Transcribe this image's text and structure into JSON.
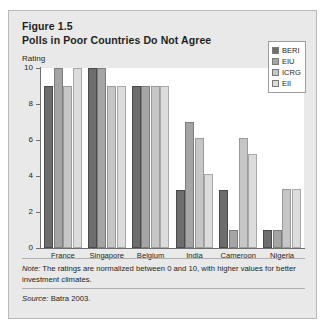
{
  "figure": {
    "number_line": "Figure 1.5",
    "title_line": "Polls in Poor Countries Do Not Agree",
    "note_label": "Note:",
    "note_text": " The ratings are normalized between 0 and 10, with higher values for better investment climates.",
    "source_label": "Source:",
    "source_text": " Batra 2003."
  },
  "colors": {
    "panel_background": "#e9e9e9",
    "panel_border": "#b9b9b9",
    "plot_background": "#ffffff",
    "axis": "#6f6f6f",
    "text": "#231f20",
    "series_beri": "#6d6d6d",
    "series_eiu": "#a5a5a5",
    "series_icrg": "#c6c6c6",
    "series_eii": "#dcdcdc"
  },
  "chart_data": {
    "type": "bar",
    "title": "Polls in Poor Countries Do Not Agree",
    "subtitle": "Figure 1.5",
    "xlabel": "",
    "ylabel": "Rating",
    "ylim": [
      0,
      10
    ],
    "yticks": [
      0,
      2,
      4,
      6,
      8,
      10
    ],
    "ytick_labels": [
      "0",
      "2",
      "4",
      "6",
      "8",
      "10"
    ],
    "grid": false,
    "legend_position": "top-right",
    "categories": [
      "France",
      "Singapore",
      "Belgium",
      "India",
      "Cameroon",
      "Nigeria"
    ],
    "series": [
      {
        "name": "BERI",
        "color": "#6d6d6d",
        "values": [
          9,
          10,
          9,
          3.2,
          3.2,
          1.0
        ]
      },
      {
        "name": "EIU",
        "color": "#a5a5a5",
        "values": [
          10,
          10,
          9,
          7.0,
          1.0,
          1.0
        ]
      },
      {
        "name": "ICRG",
        "color": "#c6c6c6",
        "values": [
          9,
          9,
          9,
          6.1,
          6.1,
          3.3
        ]
      },
      {
        "name": "EII",
        "color": "#dcdcdc",
        "values": [
          10,
          9,
          9,
          4.1,
          5.2,
          3.3
        ]
      }
    ]
  }
}
